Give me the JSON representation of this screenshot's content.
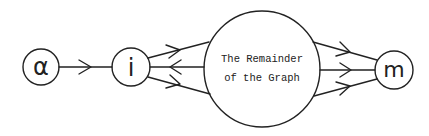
{
  "diagram": {
    "nodes": [
      {
        "id": "alpha",
        "label": "α",
        "cx": 41,
        "cy": 67,
        "r": 18
      },
      {
        "id": "i",
        "label": "i",
        "cx": 131,
        "cy": 67,
        "r": 19
      },
      {
        "id": "remainder",
        "label_line1": "The Remainder",
        "label_line2": "of the Graph",
        "cx": 262,
        "cy": 69,
        "r": 58
      },
      {
        "id": "m",
        "label": "m",
        "cx": 394,
        "cy": 70,
        "r": 19
      }
    ],
    "edges": [
      {
        "from": "alpha",
        "to": "i",
        "direction": "forward"
      },
      {
        "from": "i",
        "to": "remainder",
        "direction": "forward",
        "position": "upper"
      },
      {
        "from": "remainder",
        "to": "i",
        "direction": "backward",
        "position": "middle"
      },
      {
        "from": "i",
        "to": "remainder",
        "direction": "forward",
        "position": "lower"
      },
      {
        "from": "remainder",
        "to": "m",
        "direction": "forward",
        "position": "upper"
      },
      {
        "from": "remainder",
        "to": "m",
        "direction": "forward",
        "position": "middle"
      },
      {
        "from": "remainder",
        "to": "m",
        "direction": "forward",
        "position": "lower"
      }
    ],
    "stroke_color": "#222222"
  }
}
